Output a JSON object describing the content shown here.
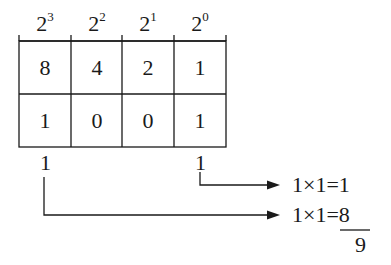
{
  "diagram": {
    "title": "",
    "type": "binary-to-decimal-conversion",
    "headers": [
      {
        "base": "2",
        "exponent": "3"
      },
      {
        "base": "2",
        "exponent": "2"
      },
      {
        "base": "2",
        "exponent": "1"
      },
      {
        "base": "2",
        "exponent": "0"
      }
    ],
    "place_values": [
      "8",
      "4",
      "2",
      "1"
    ],
    "binary_digits": [
      "1",
      "0",
      "0",
      "1"
    ],
    "extracted_bits": {
      "left": "1",
      "right": "1"
    },
    "equations": [
      {
        "text": "1×1=1"
      },
      {
        "lhs": "1×1=",
        "rhs": "8"
      }
    ],
    "sum_result": "9",
    "colors": {
      "ink": "#1a1a1a",
      "background": "#ffffff"
    }
  }
}
